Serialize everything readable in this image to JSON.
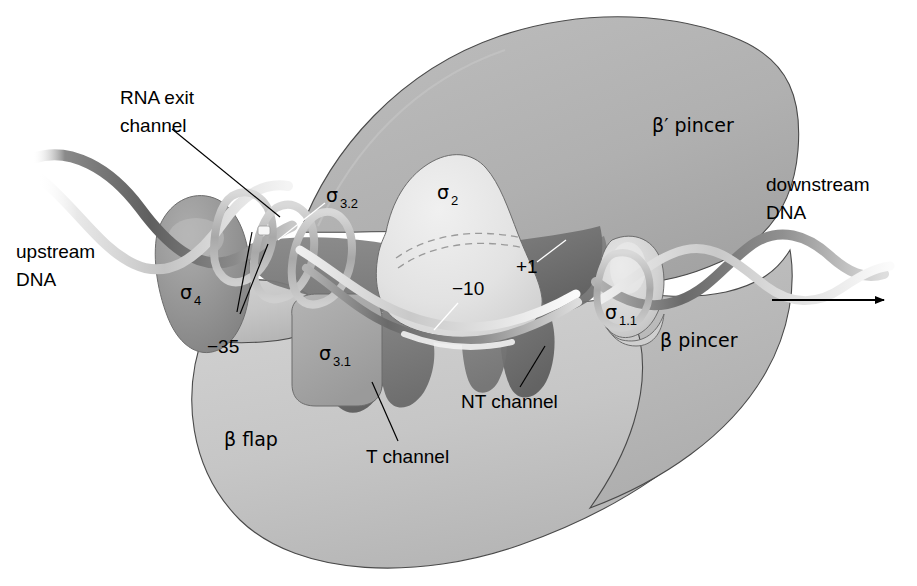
{
  "figure": {
    "background_color": "#ffffff",
    "palette": {
      "body_light": "#c9c9c9",
      "beta_flap": "#c4c4c4",
      "beta_prime_pincer": "#b2b2b2",
      "beta_pincer": "#b9b9b9",
      "sigma2_light": "#e2e2e2",
      "sigma4_dark": "#8f8f8f",
      "sigma3_mid": "#a3a3a3",
      "channel_dark": "#7c7c7c",
      "channel_darker": "#686868",
      "dna_dark": "#6f6f6f",
      "dna_light": "#dcdcdc",
      "outline": "#4a4a4a",
      "label_text": "#000000"
    }
  },
  "labels": {
    "rna_exit_channel": "RNA exit\nchannel",
    "rna_exit_channel_line1": "RNA exit",
    "rna_exit_channel_line2": "channel",
    "upstream_dna_line1": "upstream",
    "upstream_dna_line2": "DNA",
    "downstream_dna_line1": "downstream",
    "downstream_dna_line2": "DNA",
    "beta_prime_pincer": "β′ pincer",
    "beta_pincer": "β pincer",
    "beta_flap": "β flap",
    "t_channel": "T channel",
    "nt_channel": "NT channel",
    "minus_35": "−35",
    "minus_10": "−10",
    "plus_1": "+1",
    "sigma_greek": "σ",
    "sigma4_sub": "4",
    "sigma32_sub": "3.2",
    "sigma31_sub": "3.1",
    "sigma2_sub": "2",
    "sigma11_sub": "1.1"
  },
  "annotations": {
    "direction_arrow": "transcription-direction-arrow",
    "hidden_dna_dashed": "dna-path-under-sigma2"
  }
}
